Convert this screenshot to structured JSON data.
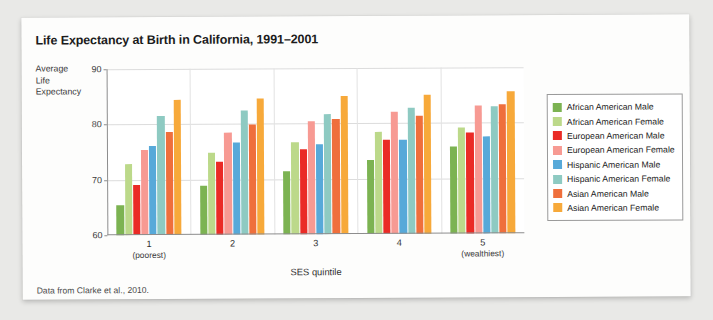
{
  "card": {
    "title": "Life Expectancy at Birth in California, 1991–2001",
    "source_note": "Data from Clarke et al., 2010."
  },
  "axis_caption": {
    "line1": "Average",
    "line2": "Life",
    "line3": "Expectancy"
  },
  "chart_data": {
    "type": "bar",
    "title": "Life Expectancy at Birth in California, 1991–2001",
    "xlabel": "SES quintile",
    "ylabel": "Average Life Expectancy",
    "ylim": [
      60,
      90
    ],
    "yticks": [
      60,
      70,
      80,
      90
    ],
    "grid": true,
    "legend_position": "right",
    "categories": [
      "1",
      "2",
      "3",
      "4",
      "5"
    ],
    "category_sublabels": [
      "(poorest)",
      "",
      "",
      "",
      "(wealthiest)"
    ],
    "series": [
      {
        "name": "African American Male",
        "color": "#7cb352",
        "values": [
          65.4,
          68.9,
          71.4,
          73.4,
          75.7
        ]
      },
      {
        "name": "African American Female",
        "color": "#bcd98a",
        "values": [
          72.8,
          74.9,
          76.6,
          78.5,
          79.2
        ]
      },
      {
        "name": "European American Male",
        "color": "#ea2b26",
        "values": [
          69.0,
          73.2,
          75.4,
          77.0,
          78.3
        ]
      },
      {
        "name": "European American Female",
        "color": "#f79a93",
        "values": [
          75.3,
          78.4,
          80.5,
          82.0,
          83.2
        ]
      },
      {
        "name": "Hispanic American Male",
        "color": "#57a9d9",
        "values": [
          76.0,
          76.7,
          76.2,
          77.0,
          77.6
        ]
      },
      {
        "name": "Hispanic American Female",
        "color": "#8ecac2",
        "values": [
          81.5,
          82.4,
          81.7,
          82.8,
          82.9
        ]
      },
      {
        "name": "Asian American Male",
        "color": "#ef6f3c",
        "values": [
          78.6,
          79.9,
          80.8,
          81.3,
          83.3
        ]
      },
      {
        "name": "Asian American Female",
        "color": "#f7a93a",
        "values": [
          84.4,
          84.6,
          85.0,
          85.2,
          85.6
        ]
      }
    ]
  }
}
